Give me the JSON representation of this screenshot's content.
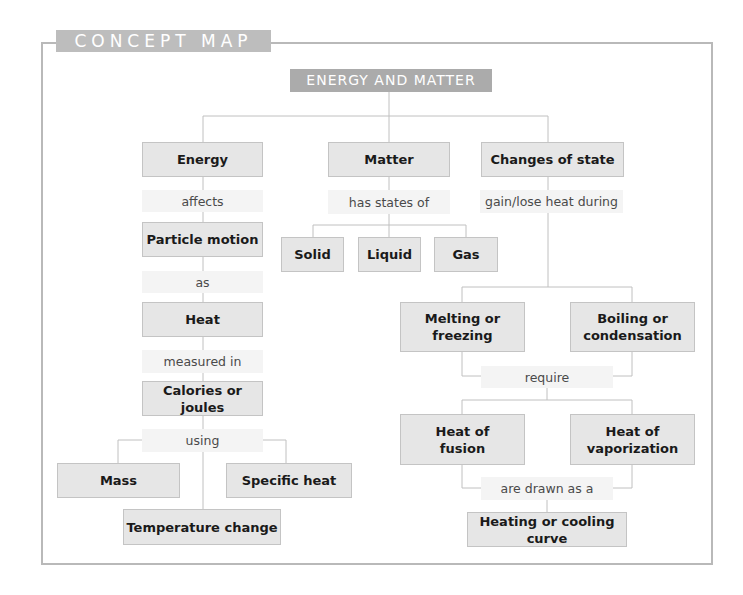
{
  "title": "CONCEPT MAP",
  "root": "ENERGY AND MATTER",
  "branches": {
    "energy": {
      "node": "Energy",
      "link1": "affects",
      "particle_motion": "Particle motion",
      "link2": "as",
      "heat": "Heat",
      "link3": "measured in",
      "calories": "Calories or joules",
      "link4": "using",
      "mass": "Mass",
      "specific_heat": "Specific heat",
      "temperature_change": "Temperature change"
    },
    "matter": {
      "node": "Matter",
      "link": "has states of",
      "states": [
        "Solid",
        "Liquid",
        "Gas"
      ]
    },
    "changes": {
      "node": "Changes of state",
      "link1": "gain/lose heat during",
      "melting": "Melting or freezing",
      "boiling": "Boiling or condensation",
      "link2": "require",
      "fusion": "Heat of fusion",
      "vaporization": "Heat of vaporization",
      "link3": "are drawn as a",
      "curve": "Heating or cooling curve"
    }
  },
  "colors": {
    "title_tab": "#bdbdbd",
    "root_box": "#ababab",
    "node_fill": "#e6e6e6",
    "link_fill": "#f4f4f4",
    "frame": "#b9b9b9"
  }
}
